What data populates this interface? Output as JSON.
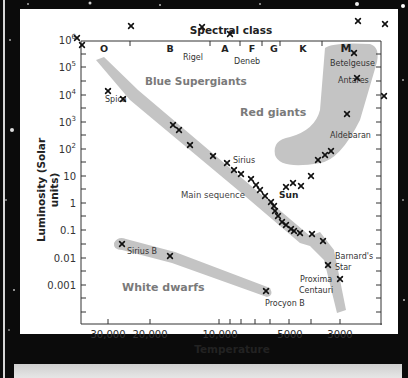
{
  "chart_data": {
    "type": "scatter",
    "title": "Spectral class",
    "xlabel": "Temperature",
    "ylabel": "Luminosity (Solar units)",
    "x_scale": "log, reversed",
    "y_scale": "log",
    "x_tick_labels": [
      "30,000",
      "20,000",
      "10,000",
      "5000",
      "3000"
    ],
    "y_tick_labels": [
      "10⁶",
      "10⁵",
      "10⁴",
      "10³",
      "10²",
      "10",
      "1",
      "0.1",
      "0.01",
      "0.001"
    ],
    "spectral_classes": [
      "O",
      "B",
      "A",
      "F",
      "G",
      "K",
      "M"
    ],
    "regions": [
      {
        "name": "Blue Supergiants",
        "label": "Blue Supergiants"
      },
      {
        "name": "Red giants",
        "label": "Red giants"
      },
      {
        "name": "Main sequence",
        "label": "Main sequence"
      },
      {
        "name": "White dwarfs",
        "label": "White dwarfs"
      }
    ],
    "labeled_stars": [
      {
        "name": "Rigel",
        "temperature": 11000,
        "luminosity": 200000
      },
      {
        "name": "Deneb",
        "temperature": 8500,
        "luminosity": 150000
      },
      {
        "name": "Betelgeuse",
        "temperature": 3300,
        "luminosity": 140000
      },
      {
        "name": "Antares",
        "temperature": 3300,
        "luminosity": 35000
      },
      {
        "name": "Spica",
        "temperature": 25000,
        "luminosity": 13000
      },
      {
        "name": "Aldebaran",
        "temperature": 3900,
        "luminosity": 300
      },
      {
        "name": "Sirius",
        "temperature": 9500,
        "luminosity": 23
      },
      {
        "name": "Sun",
        "temperature": 5800,
        "luminosity": 1
      },
      {
        "name": "Sirius B",
        "temperature": 26000,
        "luminosity": 0.03
      },
      {
        "name": "Procyon B",
        "temperature": 6800,
        "luminosity": 0.0006
      },
      {
        "name": "Barnard's Star",
        "temperature": 3200,
        "luminosity": 0.005
      },
      {
        "name": "Proxima Centauri",
        "temperature": 3000,
        "luminosity": 0.0017
      }
    ],
    "points_px": [
      [
        131,
        26
      ],
      [
        77,
        38
      ],
      [
        82,
        45
      ],
      [
        108,
        91
      ],
      [
        123,
        99
      ],
      [
        202,
        27
      ],
      [
        230,
        34
      ],
      [
        358,
        21
      ],
      [
        385,
        24
      ],
      [
        354,
        53
      ],
      [
        357,
        78
      ],
      [
        384,
        96
      ],
      [
        347,
        114
      ],
      [
        331,
        151
      ],
      [
        325,
        155
      ],
      [
        318,
        160
      ],
      [
        311,
        176
      ],
      [
        301,
        186
      ],
      [
        293,
        183
      ],
      [
        286,
        187
      ],
      [
        173,
        125
      ],
      [
        179,
        130
      ],
      [
        190,
        145
      ],
      [
        213,
        156
      ],
      [
        227,
        163
      ],
      [
        234,
        170
      ],
      [
        241,
        174
      ],
      [
        251,
        179
      ],
      [
        256,
        185
      ],
      [
        260,
        190
      ],
      [
        265,
        196
      ],
      [
        271,
        202
      ],
      [
        274,
        206
      ],
      [
        275,
        211
      ],
      [
        278,
        216
      ],
      [
        282,
        222
      ],
      [
        286,
        225
      ],
      [
        291,
        229
      ],
      [
        294,
        231
      ],
      [
        300,
        233
      ],
      [
        312,
        234
      ],
      [
        323,
        241
      ],
      [
        122,
        244
      ],
      [
        170,
        256
      ],
      [
        266,
        291
      ],
      [
        328,
        265
      ],
      [
        340,
        279
      ]
    ]
  },
  "labels": {
    "title": "Spectral class",
    "xlabel": "Temperature",
    "ylabel_line1": "Luminosity (Solar",
    "ylabel_line2": "units)",
    "classes": {
      "O": "O",
      "B": "B",
      "A": "A",
      "F": "F",
      "G": "G",
      "K": "K",
      "M": "M"
    },
    "regions": {
      "blue_supergiants": "Blue Supergiants",
      "red_giants": "Red giants",
      "main_sequence": "Main sequence",
      "white_dwarfs": "White dwarfs"
    },
    "stars": {
      "rigel": "Rigel",
      "deneb": "Deneb",
      "betelgeuse": "Betelgeuse",
      "antares": "Antares",
      "spica": "Spica",
      "aldebaran": "Aldebaran",
      "sirius": "Sirius",
      "sun": "Sun",
      "sirius_b": "Sirius B",
      "procyon_b": "Procyon B",
      "barnards_1": "Barnard's",
      "barnards_2": "Star",
      "proxima_1": "Proxima",
      "proxima_2": "Centauri"
    },
    "yticks": {
      "t6": "10",
      "t6e": "6",
      "t5": "10",
      "t5e": "5",
      "t4": "10",
      "t4e": "4",
      "t3": "10",
      "t3e": "3",
      "t2": "10",
      "t2e": "2",
      "t10": "10",
      "t1": "1",
      "t01": "0.1",
      "t001": "0.01",
      "t0001": "0.001"
    },
    "xticks": {
      "x30000": "30,000",
      "x20000": "20,000",
      "x10000": "10,000",
      "x5000": "5000",
      "x3000": "3000"
    }
  },
  "colors": {
    "band": "#c4c4c4",
    "region_label": "#7a7a7a",
    "text": "#222222",
    "axis": "#333333",
    "background": "#0b0b0b",
    "panel": "#ffffff"
  }
}
